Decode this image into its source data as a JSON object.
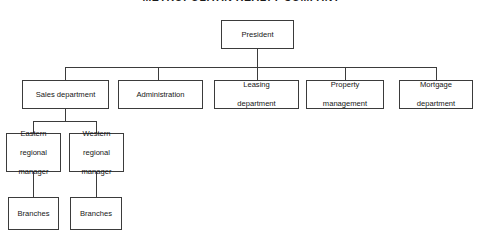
{
  "chart": {
    "title": "METROPOLITAN REALTY COMPANY",
    "type": "organization-chart",
    "levels": 4,
    "colors": {
      "line": "#3b3b3b",
      "box_border": "#3b3b3b",
      "box_fill": "#ffffff",
      "text": "#161616",
      "title_text": "#1b1b1b"
    },
    "nodes": {
      "president": {
        "label": "President"
      },
      "sales_department": {
        "label": "Sales department"
      },
      "administration": {
        "label": "Administration"
      },
      "leasing_department": {
        "label": "Leasing\ndepartment",
        "line1": "Leasing",
        "line2": "department"
      },
      "property_management": {
        "label": "Property\nmanagement",
        "line1": "Property",
        "line2": "management"
      },
      "mortgage_department": {
        "label": "Mortgage\ndepartment",
        "line1": "Mortgage",
        "line2": "department"
      },
      "eastern_regional_manager": {
        "line1": "Eastern",
        "line2": "regional",
        "line3": "manager"
      },
      "western_regional_manager": {
        "line1": "Western",
        "line2": "regional",
        "line3": "manager"
      },
      "eastern_branches": {
        "label": "Branches"
      },
      "western_branches": {
        "label": "Branches"
      }
    },
    "hierarchy": [
      {
        "parent": "president",
        "children": [
          "sales_department",
          "administration",
          "leasing_department",
          "property_management",
          "mortgage_department"
        ]
      },
      {
        "parent": "sales_department",
        "children": [
          "eastern_regional_manager",
          "western_regional_manager"
        ]
      },
      {
        "parent": "eastern_regional_manager",
        "children": [
          "eastern_branches"
        ]
      },
      {
        "parent": "western_regional_manager",
        "children": [
          "western_branches"
        ]
      }
    ]
  }
}
